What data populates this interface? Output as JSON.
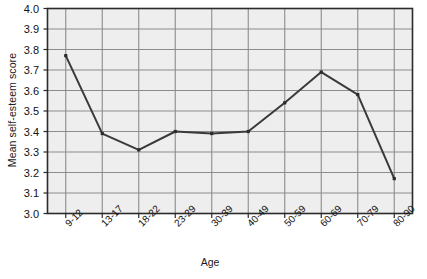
{
  "chart_data": {
    "type": "line",
    "title": "",
    "xlabel": "Age",
    "ylabel": "Mean self-esteem score",
    "categories": [
      "9-12",
      "13-17",
      "18-22",
      "23-29",
      "30-39",
      "40-49",
      "50-59",
      "60-69",
      "70-79",
      "80-90"
    ],
    "values": [
      3.77,
      3.39,
      3.31,
      3.4,
      3.39,
      3.4,
      3.54,
      3.69,
      3.58,
      3.17
    ],
    "series": [
      {
        "name": "Mean self-esteem score",
        "values": [
          3.77,
          3.39,
          3.31,
          3.4,
          3.39,
          3.4,
          3.54,
          3.69,
          3.58,
          3.17
        ]
      }
    ],
    "ylim": [
      3.0,
      4.0
    ],
    "ytick_labels": [
      "4.0",
      "3.9",
      "3.8",
      "3.7",
      "3.6",
      "3.5",
      "3.4",
      "3.3",
      "3.2",
      "3.1",
      "3.0"
    ],
    "ytick_values": [
      4.0,
      3.9,
      3.8,
      3.7,
      3.6,
      3.5,
      3.4,
      3.3,
      3.2,
      3.1,
      3.0
    ],
    "grid": true,
    "legend": "none",
    "marker": "square",
    "line_color": "#3a3a3a",
    "marker_color": "#2b2b2b",
    "grid_color": "#8c8c8c",
    "plot_background": "#eeeeee",
    "axis_color": "#2b2b2b"
  }
}
